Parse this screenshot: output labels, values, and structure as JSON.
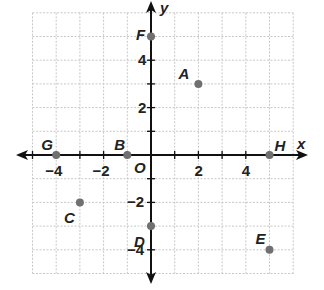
{
  "chart_data": {
    "type": "scatter",
    "title": "",
    "xlabel": "x",
    "ylabel": "y",
    "origin_label": "O",
    "xlim": [
      -5,
      6
    ],
    "ylim": [
      -5,
      6
    ],
    "grid": true,
    "x_ticks": [
      -4,
      -2,
      2,
      4
    ],
    "y_ticks": [
      4,
      2,
      -2,
      -4
    ],
    "x_tick_labels": [
      "−4",
      "−2",
      "2",
      "4"
    ],
    "y_tick_labels": [
      "4",
      "2",
      "−2",
      "−4"
    ],
    "points": [
      {
        "label": "A",
        "x": 2,
        "y": 3
      },
      {
        "label": "B",
        "x": -1,
        "y": 0
      },
      {
        "label": "C",
        "x": -3,
        "y": -2
      },
      {
        "label": "D",
        "x": 0,
        "y": -3
      },
      {
        "label": "E",
        "x": 5,
        "y": -4
      },
      {
        "label": "F",
        "x": 0,
        "y": 5
      },
      {
        "label": "G",
        "x": -4,
        "y": 0
      },
      {
        "label": "H",
        "x": 5,
        "y": 0
      }
    ],
    "colors": {
      "axis": "#111111",
      "grid": "#c8c8c8",
      "point": "#707070",
      "text": "#222222"
    }
  }
}
